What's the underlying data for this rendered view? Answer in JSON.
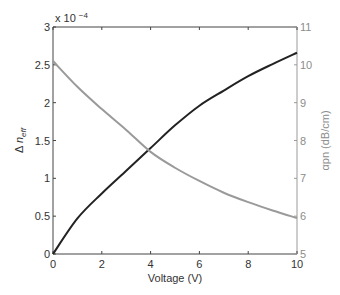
{
  "chart_data": {
    "type": "line",
    "title": "",
    "xlabel": "Voltage (V)",
    "ylabel": "Δ n_eff",
    "ylabel_right": "αpn (dB/cm)",
    "y_multiplier_label": "x 10",
    "y_multiplier_exp": "−4",
    "xlim": [
      0,
      10
    ],
    "ylim": [
      0,
      3
    ],
    "ylim_right": [
      5,
      11
    ],
    "x_ticks": [
      0,
      2,
      4,
      6,
      8,
      10
    ],
    "y_ticks": [
      0,
      0.5,
      1,
      1.5,
      2,
      2.5,
      3
    ],
    "y_ticks_right": [
      5,
      6,
      7,
      8,
      9,
      10,
      11
    ],
    "grid": false,
    "legend": null,
    "x": [
      0,
      1,
      2,
      3,
      4,
      5,
      6,
      7,
      8,
      9,
      10
    ],
    "series": [
      {
        "name": "Δ n_eff (x 10^-4)",
        "axis": "left",
        "color": "#222222",
        "values": [
          0,
          0.47,
          0.8,
          1.1,
          1.4,
          1.7,
          1.96,
          2.16,
          2.35,
          2.51,
          2.66
        ]
      },
      {
        "name": "αpn (dB/cm)",
        "axis": "right",
        "color": "#9a9a9a",
        "values": [
          10.1,
          9.42,
          8.83,
          8.28,
          7.7,
          7.28,
          6.93,
          6.62,
          6.37,
          6.15,
          5.95
        ]
      }
    ]
  }
}
